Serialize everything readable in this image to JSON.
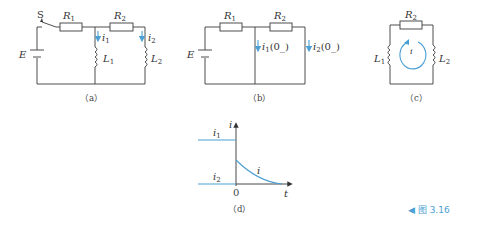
{
  "figure": {
    "caption": "◀ 图 3.16",
    "accent_color": "#4a9fd4",
    "panels": {
      "a": {
        "label": "（a）",
        "switch": "S",
        "source": "E",
        "resistors": [
          "R1",
          "R2"
        ],
        "inductors": [
          "L1",
          "L2"
        ],
        "currents": [
          "i1",
          "i2"
        ]
      },
      "b": {
        "label": "（b）",
        "source": "E",
        "resistors": [
          "R1",
          "R2"
        ],
        "currents": [
          "i1(0_)",
          "i2(0_)"
        ]
      },
      "c": {
        "label": "（c）",
        "resistor": "R2",
        "inductors": [
          "L1",
          "L2"
        ],
        "loop_current": "i"
      },
      "d": {
        "label": "（d）",
        "y_axis": "i",
        "x_axis": "t",
        "origin": "0",
        "curves": [
          "i1",
          "i2",
          "i"
        ]
      }
    }
  }
}
